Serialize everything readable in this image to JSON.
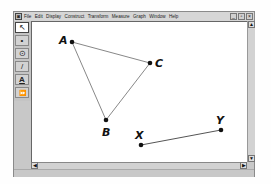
{
  "app": {
    "menu": [
      "File",
      "Edit",
      "Display",
      "Construct",
      "Transform",
      "Measure",
      "Graph",
      "Window",
      "Help"
    ],
    "window_controls": [
      {
        "name": "minimize",
        "glyph": "_"
      },
      {
        "name": "maximize",
        "glyph": "▫"
      },
      {
        "name": "close",
        "glyph": "×"
      }
    ]
  },
  "toolbar": {
    "tools": [
      {
        "name": "selection-arrow",
        "glyph": "↖",
        "active": true
      },
      {
        "name": "point",
        "glyph": "•",
        "active": false
      },
      {
        "name": "compass",
        "glyph": "⊙",
        "active": false
      },
      {
        "name": "straightedge",
        "glyph": "/",
        "active": false
      },
      {
        "name": "text",
        "glyph": "A",
        "active": false
      },
      {
        "name": "custom",
        "glyph": "⏩",
        "active": false
      }
    ]
  },
  "scrollbars": {
    "up_glyph": "▲",
    "down_glyph": "▼",
    "left_glyph": "◀",
    "right_glyph": "▶"
  },
  "sketch": {
    "points": [
      {
        "id": "A",
        "label": "A"
      },
      {
        "id": "B",
        "label": "B"
      },
      {
        "id": "C",
        "label": "C"
      },
      {
        "id": "X",
        "label": "X"
      },
      {
        "id": "Y",
        "label": "Y"
      }
    ],
    "segments": [
      {
        "from": "A",
        "to": "C"
      },
      {
        "from": "A",
        "to": "B"
      },
      {
        "from": "B",
        "to": "C"
      },
      {
        "from": "X",
        "to": "Y"
      }
    ]
  }
}
